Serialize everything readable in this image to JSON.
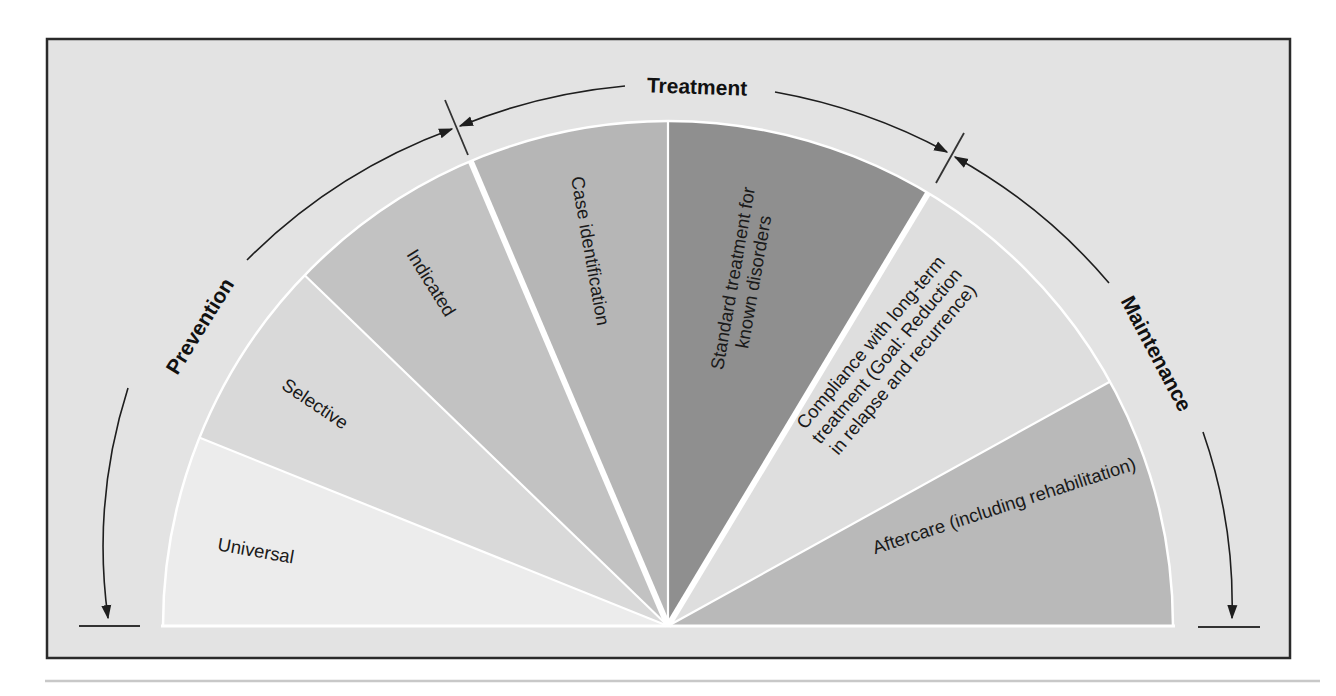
{
  "diagram": {
    "type": "semicircular-fan",
    "phases": [
      {
        "id": "prevention",
        "label": "Prevention"
      },
      {
        "id": "treatment",
        "label": "Treatment"
      },
      {
        "id": "maintenance",
        "label": "Maintenance"
      }
    ],
    "wedges": [
      {
        "id": "universal",
        "label_lines": [
          "Universal"
        ],
        "phase": "prevention",
        "color": "#ececec"
      },
      {
        "id": "selective",
        "label_lines": [
          "Selective"
        ],
        "phase": "prevention",
        "color": "#d9d9d9"
      },
      {
        "id": "indicated",
        "label_lines": [
          "Indicated"
        ],
        "phase": "prevention",
        "color": "#c2c2c2"
      },
      {
        "id": "case-identification",
        "label_lines": [
          "Case identification"
        ],
        "phase": "treatment",
        "color": "#b6b6b6"
      },
      {
        "id": "standard-treatment",
        "label_lines": [
          "Standard treatment for",
          "known disorders"
        ],
        "phase": "treatment",
        "color": "#8f8f8f"
      },
      {
        "id": "compliance",
        "label_lines": [
          "Compliance with long-term",
          "treatment (Goal: Reduction",
          "in relapse and recurrence)"
        ],
        "phase": "maintenance",
        "color": "#dedede"
      },
      {
        "id": "aftercare",
        "label_lines": [
          "Aftercare (including rehabilitation)"
        ],
        "phase": "maintenance",
        "color": "#b9b9b9"
      }
    ],
    "colors": {
      "background": "#e3e3e3",
      "frame": "#2a2a2a",
      "separator": "#ffffff",
      "arc": "#1e1e1e",
      "text": "#111111"
    }
  }
}
